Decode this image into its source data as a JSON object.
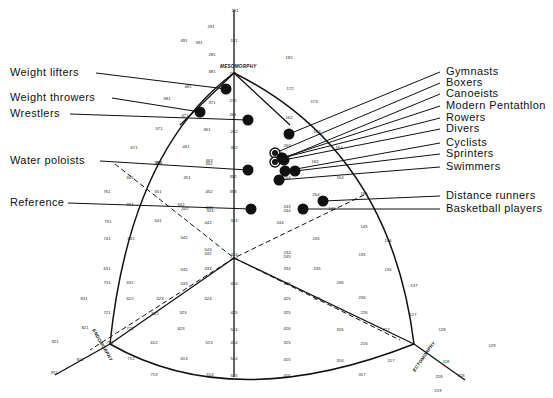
{
  "diagram": {
    "type": "somatochart",
    "axes": {
      "mesomorphy": "MESOMORPHY",
      "endomorphy": "ENDOMORPHY",
      "ectomorphy": "ECTOMORPHY"
    },
    "groups_left": [
      {
        "label": "Weight lifters",
        "ly": 76,
        "px": 226,
        "py": 89
      },
      {
        "label": "Weight throwers",
        "ly": 101,
        "px": 200,
        "py": 112
      },
      {
        "label": "Wrestlers",
        "ly": 117,
        "px": 248,
        "py": 120
      },
      {
        "label": "Water poloists",
        "ly": 164,
        "px": 248,
        "py": 170
      },
      {
        "label": "Reference",
        "ly": 206,
        "px": 251,
        "py": 209
      }
    ],
    "groups_right": [
      {
        "label": "Gymnasts",
        "ly": 75,
        "px": 289,
        "py": 134,
        "ring": false
      },
      {
        "label": "Boxers",
        "ly": 86,
        "px": 275,
        "py": 153,
        "ring": true
      },
      {
        "label": "Canoeists",
        "ly": 97,
        "px": 275,
        "py": 162,
        "ring": true
      },
      {
        "label": "Modern Pentathlon",
        "ly": 109,
        "px": 282,
        "py": 158,
        "ring": false
      },
      {
        "label": "Rowers",
        "ly": 121,
        "px": 282,
        "py": 158,
        "ring": false
      },
      {
        "label": "Divers",
        "ly": 132,
        "px": 284,
        "py": 160,
        "ring": false
      },
      {
        "label": "Cyclists",
        "ly": 146,
        "px": 285,
        "py": 171,
        "ring": false
      },
      {
        "label": "Sprinters",
        "ly": 157,
        "px": 295,
        "py": 171,
        "ring": false
      },
      {
        "label": "Swimmers",
        "ly": 170,
        "px": 279,
        "py": 180,
        "ring": false
      },
      {
        "label": "Distance runners",
        "ly": 199,
        "px": 323,
        "py": 201,
        "ring": false
      },
      {
        "label": "Basketball players",
        "ly": 212,
        "px": 303,
        "py": 209,
        "ring": false
      }
    ],
    "grid_numbers": [
      [
        "191",
        235,
        12
      ],
      [
        "291",
        211,
        28
      ],
      [
        "181",
        234,
        42
      ],
      [
        "491",
        184,
        42
      ],
      [
        "391",
        199,
        44
      ],
      [
        "281",
        212,
        56
      ],
      [
        "182",
        289,
        59
      ],
      [
        "381",
        212,
        73
      ],
      [
        "271",
        233,
        75
      ],
      [
        "172",
        290,
        90
      ],
      [
        "481",
        188,
        88
      ],
      [
        "173",
        314,
        103
      ],
      [
        "581",
        167,
        100
      ],
      [
        "371",
        212,
        104
      ],
      [
        "272",
        233,
        102
      ],
      [
        "261",
        233,
        116
      ],
      [
        "471",
        185,
        117
      ],
      [
        "162",
        289,
        119
      ],
      [
        "571",
        159,
        130
      ],
      [
        "361",
        207,
        131
      ],
      [
        "262",
        234,
        133
      ],
      [
        "163",
        317,
        133
      ],
      [
        "671",
        134,
        149
      ],
      [
        "461",
        186,
        148
      ],
      [
        "362",
        234,
        149
      ],
      [
        "263",
        287,
        147
      ],
      [
        "164",
        339,
        149
      ],
      [
        "463",
        209,
        162
      ],
      [
        "362",
        209,
        165
      ],
      [
        "361",
        159,
        164
      ],
      [
        "253",
        278,
        159
      ],
      [
        "253",
        278,
        163
      ],
      [
        "165",
        315,
        163
      ],
      [
        "561",
        158,
        164
      ],
      [
        "451",
        187,
        179
      ],
      [
        "352",
        233,
        178
      ],
      [
        "254",
        287,
        179
      ],
      [
        "154",
        340,
        179
      ],
      [
        "661",
        130,
        179
      ],
      [
        "761",
        107,
        193
      ],
      [
        "551",
        158,
        193
      ],
      [
        "452",
        209,
        193
      ],
      [
        "353",
        233,
        193
      ],
      [
        "254",
        316,
        196
      ],
      [
        "155",
        364,
        195
      ],
      [
        "651",
        130,
        206
      ],
      [
        "552",
        181,
        206
      ],
      [
        "442",
        185,
        210
      ],
      [
        "443",
        209,
        209
      ],
      [
        "343",
        210,
        212
      ],
      [
        "243",
        287,
        208
      ],
      [
        "244",
        287,
        212
      ],
      [
        "146",
        332,
        210
      ],
      [
        "751",
        108,
        223
      ],
      [
        "541",
        158,
        222
      ],
      [
        "442",
        208,
        224
      ],
      [
        "343",
        234,
        222
      ],
      [
        "244",
        280,
        224
      ],
      [
        "145",
        364,
        228
      ],
      [
        "741",
        107,
        240
      ],
      [
        "641",
        131,
        240
      ],
      [
        "542",
        184,
        239
      ],
      [
        "543",
        208,
        251
      ],
      [
        "432",
        208,
        255
      ],
      [
        "444",
        234,
        256
      ],
      [
        "333",
        234,
        260
      ],
      [
        "234",
        287,
        254
      ],
      [
        "245",
        287,
        258
      ],
      [
        "245",
        316,
        240
      ],
      [
        "146",
        388,
        242
      ],
      [
        "135",
        362,
        256
      ],
      [
        "631",
        107,
        270
      ],
      [
        "532",
        184,
        271
      ],
      [
        "433",
        208,
        270
      ],
      [
        "334",
        287,
        270
      ],
      [
        "235",
        317,
        270
      ],
      [
        "136",
        388,
        271
      ],
      [
        "731",
        107,
        284
      ],
      [
        "632",
        130,
        284
      ],
      [
        "533",
        184,
        285
      ],
      [
        "424",
        234,
        285
      ],
      [
        "335",
        287,
        285
      ],
      [
        "236",
        340,
        284
      ],
      [
        "137",
        414,
        287
      ],
      [
        "831",
        84,
        300
      ],
      [
        "622",
        130,
        300
      ],
      [
        "523",
        160,
        300
      ],
      [
        "425",
        287,
        300
      ],
      [
        "524",
        208,
        300
      ],
      [
        "325",
        317,
        300
      ],
      [
        "236",
        362,
        299
      ],
      [
        "721",
        107,
        314
      ],
      [
        "622",
        155,
        315
      ],
      [
        "523",
        183,
        314
      ],
      [
        "425",
        234,
        314
      ],
      [
        "325",
        287,
        314
      ],
      [
        "226",
        364,
        314
      ],
      [
        "127",
        413,
        316
      ],
      [
        "821",
        85,
        329
      ],
      [
        "722",
        130,
        330
      ],
      [
        "623",
        181,
        330
      ],
      [
        "524",
        234,
        331
      ],
      [
        "426",
        287,
        330
      ],
      [
        "326",
        340,
        331
      ],
      [
        "227",
        386,
        331
      ],
      [
        "921",
        55,
        343
      ],
      [
        "711",
        110,
        344
      ],
      [
        "612",
        154,
        344
      ],
      [
        "513",
        209,
        344
      ],
      [
        "414",
        234,
        344
      ],
      [
        "315",
        287,
        344
      ],
      [
        "216",
        364,
        345
      ],
      [
        "128",
        442,
        331
      ],
      [
        "129",
        492,
        347
      ],
      [
        "712",
        131,
        360
      ],
      [
        "613",
        184,
        360
      ],
      [
        "514",
        234,
        360
      ],
      [
        "415",
        287,
        361
      ],
      [
        "316",
        340,
        362
      ],
      [
        "217",
        391,
        362
      ],
      [
        "811",
        80,
        361
      ],
      [
        "911",
        54,
        374
      ],
      [
        "713",
        154,
        376
      ],
      [
        "614",
        210,
        376
      ],
      [
        "515",
        234,
        377
      ],
      [
        "416",
        287,
        377
      ],
      [
        "317",
        362,
        376
      ],
      [
        "218",
        439,
        378
      ],
      [
        "118",
        446,
        363
      ],
      [
        "119",
        461,
        377
      ],
      [
        "219",
        438,
        392
      ]
    ],
    "colors": {
      "ink": "#111111",
      "background": "#ffffff"
    }
  }
}
